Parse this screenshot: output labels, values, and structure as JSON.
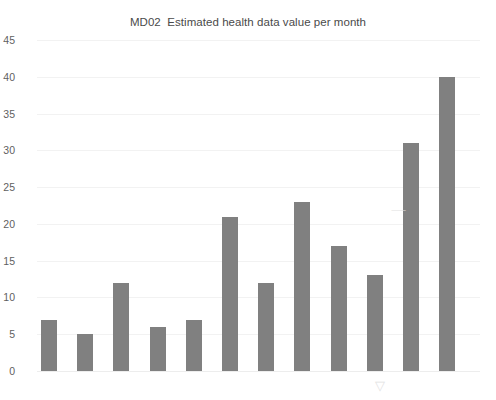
{
  "chart_data": {
    "type": "bar",
    "title": "MD02  Estimated health data value per month",
    "xlabel": "",
    "ylabel": "",
    "ylim": [
      0,
      45
    ],
    "ytick_step": 5,
    "yticks": [
      0,
      5,
      10,
      15,
      20,
      25,
      30,
      35,
      40,
      45
    ],
    "grid": true,
    "legend": false,
    "legend_position": "none",
    "bar_color": "#808080",
    "grid_color": "#f2f2f2",
    "categories": [
      "0",
      "10",
      "20",
      "30",
      "40",
      "50",
      "70",
      "100",
      "200",
      "500",
      "> 500 €",
      "priceless"
    ],
    "values": [
      7,
      5,
      12,
      6,
      7,
      21,
      12,
      23,
      17,
      13,
      31,
      40
    ],
    "series": [
      {
        "name": "Estimated health data value per month",
        "values": [
          7,
          5,
          12,
          6,
          7,
          21,
          12,
          23,
          17,
          13,
          31,
          40
        ]
      }
    ]
  },
  "artifacts": {
    "mid_mark": "⸺",
    "low_mark": "▽"
  }
}
